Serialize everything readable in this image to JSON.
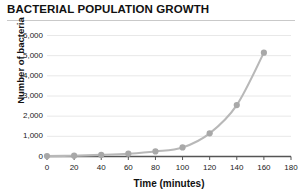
{
  "chart_data": {
    "type": "line",
    "title": "BACTERIAL POPULATION GROWTH",
    "xlabel": "Time (minutes)",
    "ylabel": "Number of bacteria",
    "xlim": [
      0,
      180
    ],
    "ylim": [
      0,
      6000
    ],
    "grid": true,
    "legend": "none",
    "marker": "circle",
    "series_color": "#b0b0b0",
    "x": [
      0,
      20,
      40,
      60,
      80,
      100,
      120,
      140,
      160,
      180
    ],
    "xtick_labels": [
      "0",
      "20",
      "40",
      "60",
      "80",
      "100",
      "120",
      "140",
      "160",
      "180"
    ],
    "ytick_values": [
      0,
      1000,
      2000,
      3000,
      4000,
      5000,
      6000
    ],
    "ytick_labels": [
      "0",
      "1,000",
      "2,000",
      "3,000",
      "4,000",
      "5,000",
      "6,000"
    ],
    "series": [
      {
        "name": "Bacteria count",
        "values": [
          20,
          40,
          80,
          140,
          250,
          450,
          1150,
          2550,
          5150,
          null
        ]
      }
    ]
  },
  "colors": {
    "line": "#b8b8b8",
    "marker": "#a8a8a8",
    "gridline": "#e8e8e8",
    "axis": "#555555",
    "title_rule": "#c9c9c9",
    "text": "#111111"
  }
}
